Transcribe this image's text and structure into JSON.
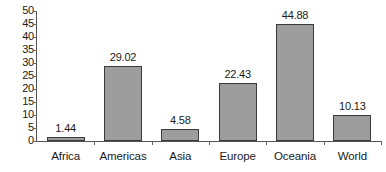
{
  "chart_data": {
    "type": "bar",
    "title": "",
    "subtitle": "",
    "xlabel": "",
    "ylabel": "",
    "categories": [
      "Africa",
      "Americas",
      "Asia",
      "Europe",
      "Oceania",
      "World"
    ],
    "values": [
      1.44,
      29.02,
      4.58,
      22.43,
      44.88,
      10.13
    ],
    "value_labels": [
      "1.44",
      "29.02",
      "4.58",
      "22.43",
      "44.88",
      "10.13"
    ],
    "ylim": [
      0,
      50
    ],
    "ytick_step": 5,
    "ytick_labels": [
      "50",
      "45",
      "40",
      "35",
      "30",
      "25",
      "20",
      "15",
      "10",
      "5",
      "0"
    ],
    "ytick_values": [
      50,
      45,
      40,
      35,
      30,
      25,
      20,
      15,
      10,
      5,
      0
    ],
    "grid": false,
    "legend": false,
    "legend_position": "none",
    "bar_fill_color": "#9d9d9d",
    "bar_border_color": "#3a3a3a",
    "axis_color": "#555555",
    "text_color": "#1a1a1a",
    "background_color": "#ffffff"
  }
}
